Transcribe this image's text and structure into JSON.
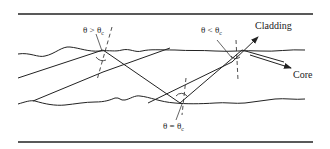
{
  "diagram": {
    "type": "optical-fiber-total-internal-reflection",
    "colors": {
      "line": "#222222",
      "background": "#ffffff"
    },
    "labels": {
      "cladding": "Cladding",
      "core": "Core",
      "angle_greater": {
        "main": "θ > θ",
        "sub": "c"
      },
      "angle_less": {
        "main": "θ < θ",
        "sub": "c"
      },
      "angle_equal": {
        "main": "θ = θ",
        "sub": "c"
      }
    },
    "boundaries": {
      "outer_top": "Cladding outer boundary (top)",
      "outer_bottom": "Cladding outer boundary (bottom)",
      "core_top": "Core–cladding interface (top, wavy)",
      "core_bottom": "Core–cladding interface (bottom, wavy)"
    }
  }
}
